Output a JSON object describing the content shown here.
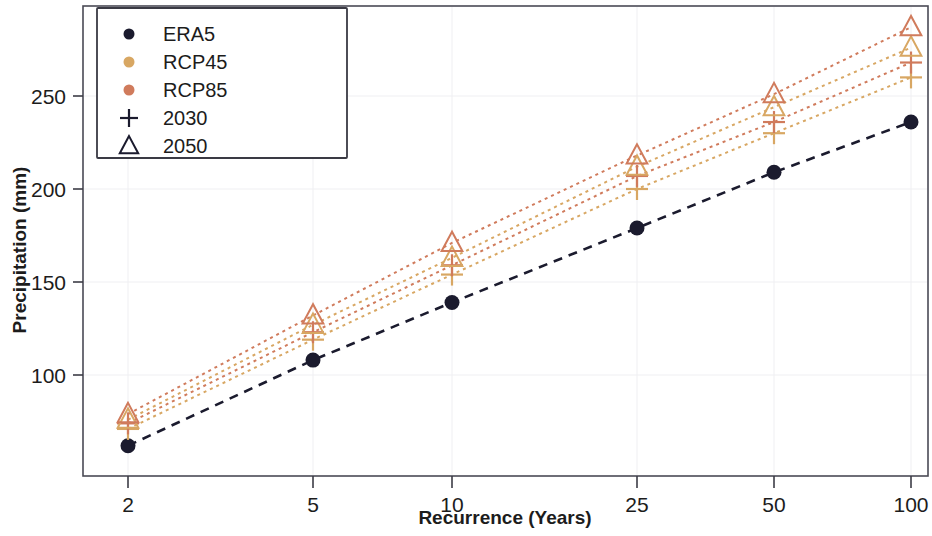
{
  "chart_data": {
    "type": "line",
    "title": "",
    "xlabel": "Recurrence (Years)",
    "ylabel": "Precipitation (mm)",
    "x_tick_labels": [
      "2",
      "5",
      "10",
      "25",
      "50",
      "100"
    ],
    "x_values": [
      2,
      5,
      10,
      25,
      50,
      100
    ],
    "x_scale": "gumbel-return-period",
    "y_tick_labels": [
      "100",
      "150",
      "200",
      "250"
    ],
    "y_ticks": [
      100,
      150,
      200,
      250
    ],
    "ylim": [
      55,
      295
    ],
    "grid": true,
    "legend_position": "upper-left",
    "categories": [
      "2",
      "5",
      "10",
      "25",
      "50",
      "100"
    ],
    "series": [
      {
        "name": "ERA5",
        "marker": "circle",
        "color": "#1b1b2e",
        "linestyle": "dashed",
        "values": [
          62,
          108,
          139,
          179,
          209,
          236
        ]
      },
      {
        "name": "RCP45 2030",
        "legend_color_key": "RCP45",
        "legend_marker_key": "2030",
        "marker": "plus",
        "color": "#d8a763",
        "linestyle": "dotted",
        "values": [
          71,
          119,
          154,
          200,
          230,
          260
        ]
      },
      {
        "name": "RCP85 2030",
        "legend_color_key": "RCP85",
        "legend_marker_key": "2030",
        "marker": "plus",
        "color": "#d07b5c",
        "linestyle": "dotted",
        "values": [
          74,
          123,
          159,
          207,
          236,
          268
        ]
      },
      {
        "name": "RCP45 2050",
        "legend_color_key": "RCP45",
        "legend_marker_key": "2050",
        "marker": "triangle",
        "color": "#d8a763",
        "linestyle": "dotted",
        "values": [
          76,
          127,
          163,
          212,
          244,
          276
        ]
      },
      {
        "name": "RCP85 2050",
        "legend_color_key": "RCP85",
        "legend_marker_key": "2050",
        "marker": "triangle",
        "color": "#d07b5c",
        "linestyle": "dotted",
        "values": [
          79,
          132,
          171,
          218,
          251,
          287
        ]
      }
    ],
    "legend_entries": [
      {
        "label": "ERA5",
        "marker": "circle",
        "color": "#1b1b2e"
      },
      {
        "label": "RCP45",
        "marker": "circle",
        "color": "#d8a763"
      },
      {
        "label": "RCP85",
        "marker": "circle",
        "color": "#d07b5c"
      },
      {
        "label": "2030",
        "marker": "plus",
        "color": "#1b1b2e"
      },
      {
        "label": "2050",
        "marker": "triangle",
        "color": "#1b1b2e"
      }
    ]
  }
}
